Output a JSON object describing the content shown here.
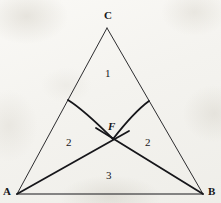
{
  "figure": {
    "kind": "geometry-diagram",
    "canvas": {
      "width": 221,
      "height": 203
    },
    "background_color": "#f6f5f2",
    "ink_color": "#16161a"
  },
  "vertices": [
    {
      "id": "C",
      "label": "C",
      "x": 107,
      "y": 28,
      "label_x": 104,
      "label_y": 10
    },
    {
      "id": "A",
      "label": "A",
      "x": 17,
      "y": 194,
      "label_x": 3,
      "label_y": 186
    },
    {
      "id": "B",
      "label": "B",
      "x": 203,
      "y": 194,
      "label_x": 208,
      "label_y": 186
    }
  ],
  "points": [
    {
      "id": "F",
      "label": "F",
      "x": 113,
      "y": 139,
      "label_x": 108,
      "label_y": 121
    },
    {
      "id": "D",
      "label": "",
      "x": 68,
      "y": 100,
      "label_x": 0,
      "label_y": 0
    },
    {
      "id": "E",
      "label": "",
      "x": 149,
      "y": 101,
      "label_x": 0,
      "label_y": 0
    }
  ],
  "segments": [
    {
      "id": "side-AC",
      "from": "A",
      "to": "C",
      "style": "thin-straight",
      "width": 0.9
    },
    {
      "id": "side-CB",
      "from": "C",
      "to": "B",
      "style": "thin-straight",
      "width": 0.9
    },
    {
      "id": "side-AB",
      "from": "A",
      "to": "B",
      "style": "thin-straight",
      "width": 0.9
    },
    {
      "id": "chord-AF-B",
      "from": "A",
      "to": "B",
      "via": "F",
      "style": "thick-straight",
      "width": 1.8
    },
    {
      "id": "arc-DF",
      "from": "D",
      "to": "F",
      "style": "thick-curve",
      "width": 1.8
    },
    {
      "id": "arc-EF",
      "from": "E",
      "to": "F",
      "style": "thick-curve",
      "width": 1.8
    }
  ],
  "regions": [
    {
      "id": "region-top",
      "label": "1",
      "label_x": 105,
      "label_y": 68
    },
    {
      "id": "region-left",
      "label": "2",
      "label_x": 66,
      "label_y": 137
    },
    {
      "id": "region-right",
      "label": "2",
      "label_x": 145,
      "label_y": 137
    },
    {
      "id": "region-bottom",
      "label": "3",
      "label_x": 106,
      "label_y": 170
    }
  ]
}
